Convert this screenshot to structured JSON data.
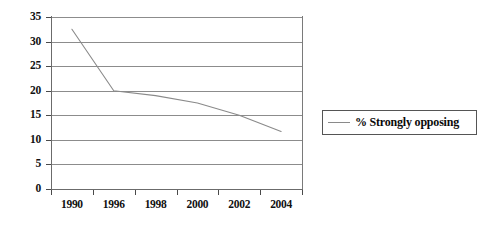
{
  "chart_data": {
    "type": "line",
    "title": "",
    "xlabel": "",
    "ylabel": "",
    "categories": [
      "1990",
      "1996",
      "1998",
      "2000",
      "2002",
      "2004"
    ],
    "series": [
      {
        "name": "% Strongly opposing",
        "values": [
          32.5,
          20,
          19,
          17.5,
          15,
          11.7
        ]
      }
    ],
    "ylim": [
      0,
      35
    ],
    "ytick_values": [
      0,
      5,
      10,
      15,
      20,
      25,
      30,
      35
    ],
    "ytick_labels": [
      "0",
      "5",
      "10",
      "15",
      "20",
      "25",
      "30",
      "35"
    ],
    "xtick_labels": [
      "1990",
      "1996",
      "1998",
      "2000",
      "2002",
      "2004"
    ],
    "grid": true,
    "legend_position": "right",
    "legend_entries": [
      "% Strongly opposing"
    ],
    "line_color": "#8a8a8a"
  },
  "legend": {
    "series_label": "% Strongly opposing",
    "swatch_icon": "line-swatch-icon"
  }
}
